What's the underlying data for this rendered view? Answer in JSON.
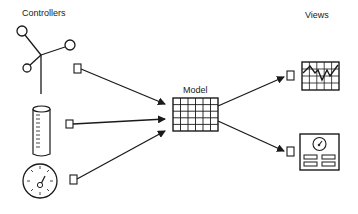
{
  "diagram": {
    "type": "mvc-architecture",
    "labels": {
      "controllers": "Controllers",
      "model": "Model",
      "views": "Views"
    },
    "controllers": [
      {
        "name": "joystick",
        "icon": "joystick-icon"
      },
      {
        "name": "slider-cylinder",
        "icon": "graduated-cylinder-icon"
      },
      {
        "name": "dial",
        "icon": "dial-gauge-icon"
      }
    ],
    "model": {
      "icon": "grid-table-icon",
      "columns": 6,
      "rows": 5
    },
    "views": [
      {
        "name": "line-chart-view",
        "icon": "line-chart-icon"
      },
      {
        "name": "dashboard-view",
        "icon": "dashboard-gauge-icon"
      }
    ],
    "edges": [
      {
        "from": "joystick",
        "to": "model"
      },
      {
        "from": "slider-cylinder",
        "to": "model"
      },
      {
        "from": "dial",
        "to": "model"
      },
      {
        "from": "model",
        "to": "line-chart-view"
      },
      {
        "from": "model",
        "to": "dashboard-view"
      }
    ],
    "colors": {
      "stroke": "#1a1a1a",
      "background": "#ffffff",
      "text": "#222222"
    }
  }
}
